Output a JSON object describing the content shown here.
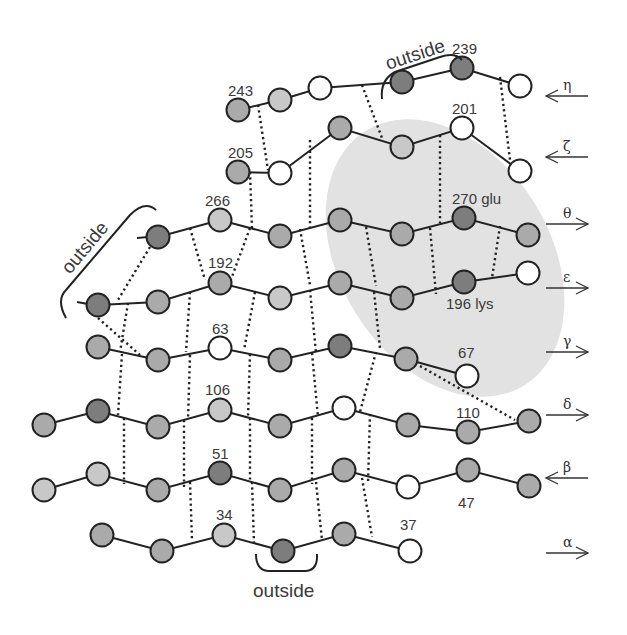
{
  "colors": {
    "dark": "#7d7d7d",
    "mid": "#aaaaaa",
    "light": "#c8c8c8",
    "white": "#ffffff",
    "stroke": "#222222",
    "highlight": "#e2e2e2"
  },
  "strands": [
    {
      "name": "eta",
      "symbol": "η",
      "direction": "left",
      "arrow_y": 96,
      "nodes": [
        [
          238,
          110,
          "mid"
        ],
        [
          280,
          100,
          "light"
        ],
        [
          320,
          88,
          "white"
        ],
        [
          402,
          82,
          "dark"
        ],
        [
          462,
          68,
          "dark"
        ],
        [
          520,
          86,
          "white"
        ]
      ]
    },
    {
      "name": "zeta",
      "symbol": "ζ",
      "direction": "left",
      "arrow_y": 157,
      "nodes": [
        [
          238,
          172,
          "mid"
        ],
        [
          280,
          173,
          "white"
        ],
        [
          340,
          128,
          "mid"
        ],
        [
          402,
          147,
          "light"
        ],
        [
          462,
          128,
          "white"
        ],
        [
          520,
          171,
          "white"
        ]
      ]
    },
    {
      "name": "theta",
      "symbol": "θ",
      "direction": "right",
      "arrow_y": 224,
      "nodes": [
        [
          158,
          237,
          "dark"
        ],
        [
          220,
          220,
          "light"
        ],
        [
          280,
          236,
          "mid"
        ],
        [
          340,
          220,
          "mid"
        ],
        [
          402,
          234,
          "mid"
        ],
        [
          464,
          218,
          "dark"
        ],
        [
          528,
          235,
          "mid"
        ]
      ]
    },
    {
      "name": "epsilon",
      "symbol": "ε",
      "direction": "right",
      "arrow_y": 288,
      "nodes": [
        [
          98,
          305,
          "dark"
        ],
        [
          158,
          302,
          "mid"
        ],
        [
          220,
          283,
          "mid"
        ],
        [
          280,
          298,
          "light"
        ],
        [
          340,
          283,
          "mid"
        ],
        [
          402,
          298,
          "mid"
        ],
        [
          464,
          282,
          "dark"
        ],
        [
          528,
          273,
          "white"
        ]
      ]
    },
    {
      "name": "gamma",
      "symbol": "γ",
      "direction": "right",
      "arrow_y": 352,
      "nodes": [
        [
          98,
          347,
          "mid"
        ],
        [
          158,
          360,
          "mid"
        ],
        [
          220,
          348,
          "white"
        ],
        [
          280,
          360,
          "mid"
        ],
        [
          340,
          346,
          "dark"
        ],
        [
          406,
          359,
          "mid"
        ],
        [
          467,
          376,
          "white"
        ]
      ]
    },
    {
      "name": "delta",
      "symbol": "δ",
      "direction": "right",
      "arrow_y": 415,
      "nodes": [
        [
          44,
          425,
          "mid"
        ],
        [
          98,
          411,
          "dark"
        ],
        [
          158,
          427,
          "mid"
        ],
        [
          220,
          410,
          "light"
        ],
        [
          280,
          426,
          "mid"
        ],
        [
          344,
          408,
          "white"
        ],
        [
          408,
          425,
          "mid"
        ],
        [
          468,
          432,
          "mid"
        ],
        [
          529,
          421,
          "mid"
        ]
      ]
    },
    {
      "name": "beta",
      "symbol": "β",
      "direction": "left",
      "arrow_y": 478,
      "nodes": [
        [
          44,
          490,
          "light"
        ],
        [
          98,
          474,
          "light"
        ],
        [
          158,
          490,
          "mid"
        ],
        [
          220,
          473,
          "dark"
        ],
        [
          280,
          490,
          "mid"
        ],
        [
          344,
          470,
          "mid"
        ],
        [
          408,
          487,
          "white"
        ],
        [
          468,
          470,
          "mid"
        ],
        [
          529,
          486,
          "mid"
        ]
      ]
    },
    {
      "name": "alpha",
      "symbol": "α",
      "direction": "right",
      "arrow_y": 553,
      "nodes": [
        [
          102,
          535,
          "mid"
        ],
        [
          162,
          551,
          "mid"
        ],
        [
          224,
          535,
          "light"
        ],
        [
          283,
          551,
          "dark"
        ],
        [
          344,
          534,
          "mid"
        ],
        [
          410,
          551,
          "white"
        ]
      ]
    }
  ],
  "residue_labels": [
    {
      "text": "243",
      "x": 228,
      "y": 96
    },
    {
      "text": "239",
      "x": 452,
      "y": 54
    },
    {
      "text": "205",
      "x": 228,
      "y": 158
    },
    {
      "text": "201",
      "x": 452,
      "y": 114
    },
    {
      "text": "266",
      "x": 205,
      "y": 206
    },
    {
      "text": "270 glu",
      "x": 452,
      "y": 204
    },
    {
      "text": "192",
      "x": 208,
      "y": 268
    },
    {
      "text": "196 lys",
      "x": 446,
      "y": 309
    },
    {
      "text": "63",
      "x": 212,
      "y": 334
    },
    {
      "text": "67",
      "x": 458,
      "y": 358
    },
    {
      "text": "106",
      "x": 205,
      "y": 395
    },
    {
      "text": "110",
      "x": 456,
      "y": 418
    },
    {
      "text": "51",
      "x": 212,
      "y": 459
    },
    {
      "text": "47",
      "x": 458,
      "y": 508
    },
    {
      "text": "34",
      "x": 216,
      "y": 520
    },
    {
      "text": "37",
      "x": 400,
      "y": 530
    }
  ],
  "annotations": {
    "outside_top": "outside",
    "outside_left": "outside",
    "outside_bottom": "outside"
  }
}
